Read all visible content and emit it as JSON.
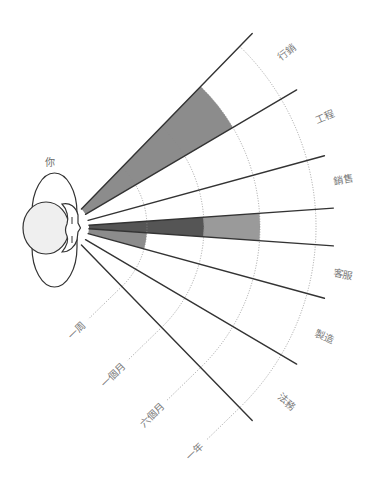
{
  "diagram": {
    "person_label": "你",
    "sectors": [
      {
        "name": "marketing",
        "label": "行銷",
        "shading": [
          {
            "from_ring": -1,
            "to_ring": 2,
            "color": "#8c8c8c"
          }
        ]
      },
      {
        "name": "engineering",
        "label": "工程",
        "shading": []
      },
      {
        "name": "sales",
        "label": "銷售",
        "shading": []
      },
      {
        "name": "own-team",
        "shading": [
          {
            "from_ring": -1,
            "to_ring": 1,
            "color": "#555555"
          },
          {
            "from_ring": 1,
            "to_ring": 2,
            "color": "#9a9a9a"
          }
        ]
      },
      {
        "name": "customer-service",
        "label": "客服",
        "shading": [
          {
            "from_ring": -1,
            "to_ring": 0,
            "color": "#8c8c8c"
          }
        ]
      },
      {
        "name": "manufacturing",
        "label": "製造",
        "shading": []
      },
      {
        "name": "legal",
        "label": "法務",
        "shading": []
      }
    ],
    "time_rings": [
      {
        "label": "一周"
      },
      {
        "label": "一個月"
      },
      {
        "label": "六個月"
      },
      {
        "label": "一年"
      }
    ],
    "colors": {
      "ray": "#333333",
      "ring": "#8a8a8a",
      "label": "#7a7a7a",
      "head_fill": "#efefef",
      "face_fill": "#ffffff"
    }
  }
}
